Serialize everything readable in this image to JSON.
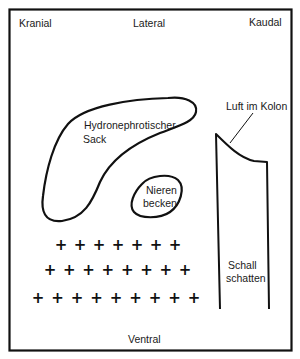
{
  "diagram": {
    "orientation": {
      "top_left": "Kranial",
      "top_center": "Lateral",
      "top_right": "Kaudal",
      "bottom_center": "Ventral"
    },
    "structures": {
      "sack": {
        "line1": "Hydronephrotischer",
        "line2": "Sack"
      },
      "pelvis": {
        "line1": "Nieren",
        "line2": "becken"
      },
      "colon_air": {
        "label": "Luft im Kolon"
      },
      "shadow": {
        "line1": "Schall",
        "line2": "schatten"
      }
    },
    "markers": {
      "symbol": "+",
      "rows": [
        7,
        8,
        9
      ]
    },
    "colors": {
      "stroke": "#111111",
      "background": "#ffffff"
    }
  }
}
